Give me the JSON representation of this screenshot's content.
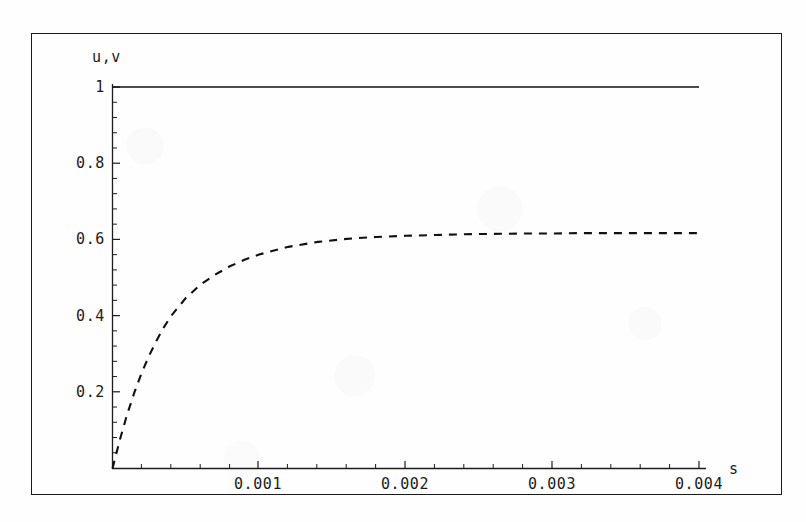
{
  "figure": {
    "name": "plot-u-v-vs-s",
    "background_color": "#fefefe",
    "frame_color": "#1a1a1a",
    "curve_color": "#111111"
  },
  "axes": {
    "ylabel": "u,v",
    "xlabel": "s",
    "x_tick_labels": [
      "0.001",
      "0.002",
      "0.003",
      "0.004"
    ],
    "y_tick_labels": [
      "1",
      "0.8",
      "0.6",
      "0.4",
      "0.2"
    ]
  },
  "chart_data": {
    "type": "line",
    "title": "",
    "xlabel": "s",
    "ylabel": "u,v",
    "xlim": [
      0,
      0.0042
    ],
    "ylim": [
      0,
      1.04
    ],
    "xticks": [
      0.001,
      0.002,
      0.003,
      0.004
    ],
    "yticks": [
      0.2,
      0.4,
      0.6,
      0.8,
      1
    ],
    "minor_ticks": true,
    "grid": false,
    "legend": "none",
    "series": [
      {
        "name": "u",
        "style": "solid",
        "color": "#111111",
        "x": [
          0.0,
          0.0002,
          0.0004,
          0.0006,
          0.0008,
          0.001,
          0.0012,
          0.0014,
          0.0016,
          0.0018,
          0.002,
          0.0022,
          0.0024,
          0.0026,
          0.0028,
          0.003,
          0.0032,
          0.0034,
          0.0036,
          0.0038,
          0.004
        ],
        "y": [
          1.0,
          1.0,
          1.0,
          1.0,
          1.0,
          1.0,
          1.0,
          1.0,
          1.0,
          1.0,
          1.0,
          1.0,
          1.0,
          1.0,
          1.0,
          1.0,
          1.0,
          1.0,
          1.0,
          1.0,
          1.0
        ]
      },
      {
        "name": "v",
        "style": "dashed",
        "color": "#111111",
        "x": [
          0.0,
          5e-05,
          0.0001,
          0.00015,
          0.0002,
          0.00025,
          0.0003,
          0.00035,
          0.0004,
          0.0005,
          0.0006,
          0.0007,
          0.0008,
          0.0009,
          0.001,
          0.0012,
          0.0014,
          0.0016,
          0.0018,
          0.002,
          0.0022,
          0.0024,
          0.0026,
          0.0028,
          0.003,
          0.0032,
          0.0034,
          0.0036,
          0.0038,
          0.004
        ],
        "y": [
          0.0,
          0.075,
          0.142,
          0.2,
          0.252,
          0.296,
          0.335,
          0.37,
          0.4,
          0.447,
          0.482,
          0.508,
          0.53,
          0.547,
          0.561,
          0.581,
          0.594,
          0.602,
          0.607,
          0.61,
          0.612,
          0.614,
          0.615,
          0.616,
          0.616,
          0.617,
          0.617,
          0.617,
          0.617,
          0.617
        ]
      }
    ]
  }
}
